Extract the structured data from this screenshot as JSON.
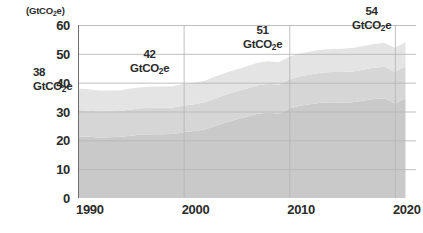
{
  "chart_data": {
    "type": "area",
    "title": "",
    "subtitle": "",
    "xlabel": "",
    "ylabel": "(GtCO2e)",
    "ylabel_html": "(GtCO<sub>2</sub>e)",
    "xlim": [
      1990,
      2022
    ],
    "ylim": [
      0,
      60
    ],
    "ytick_values": [
      0,
      10,
      20,
      30,
      40,
      50,
      60
    ],
    "ytick_labels": [
      "0",
      "10",
      "20",
      "30",
      "40",
      "50",
      "60"
    ],
    "xtick_values": [
      1990,
      2000,
      2010,
      2020
    ],
    "xtick_labels": [
      "1990",
      "2000",
      "2010",
      "2020"
    ],
    "grid": true,
    "legend_position": "none",
    "stacked": true,
    "x": [
      1990,
      1991,
      1992,
      1993,
      1994,
      1995,
      1996,
      1997,
      1998,
      1999,
      2000,
      2001,
      2002,
      2003,
      2004,
      2005,
      2006,
      2007,
      2008,
      2009,
      2010,
      2011,
      2012,
      2013,
      2014,
      2015,
      2016,
      2017,
      2018,
      2019,
      2020,
      2021
    ],
    "series": [
      {
        "name": "band-1",
        "color": "#c9c9c9",
        "values": [
          21.3,
          21.2,
          21.0,
          21.1,
          21.2,
          21.6,
          22.0,
          22.1,
          22.1,
          22.2,
          22.8,
          23.2,
          23.8,
          25.0,
          26.2,
          27.2,
          28.2,
          29.2,
          29.6,
          29.3,
          31.0,
          32.0,
          32.5,
          33.0,
          33.2,
          33.1,
          33.2,
          33.7,
          34.3,
          34.5,
          32.8,
          34.5
        ]
      },
      {
        "name": "band-2",
        "color": "#d6d6d6",
        "values": [
          9.2,
          9.1,
          9.0,
          9.0,
          9.0,
          9.1,
          9.1,
          9.2,
          9.2,
          9.2,
          9.3,
          9.3,
          9.4,
          9.5,
          9.6,
          9.7,
          9.8,
          9.9,
          10.0,
          10.0,
          10.1,
          10.2,
          10.3,
          10.4,
          10.5,
          10.6,
          10.7,
          10.8,
          10.9,
          11.0,
          11.0,
          11.1
        ]
      },
      {
        "name": "band-3",
        "color": "#e4e4e4",
        "values": [
          7.5,
          7.4,
          7.3,
          7.2,
          7.2,
          7.3,
          7.3,
          7.4,
          7.4,
          7.4,
          7.5,
          7.5,
          7.5,
          7.6,
          7.6,
          7.7,
          7.7,
          7.8,
          7.8,
          7.8,
          7.9,
          7.9,
          8.0,
          8.0,
          8.0,
          8.1,
          8.1,
          8.2,
          8.2,
          8.3,
          8.3,
          8.4
        ]
      }
    ],
    "totals": [
      38.0,
      37.7,
      37.3,
      37.3,
      37.4,
      38.0,
      38.4,
      38.7,
      38.7,
      38.8,
      39.6,
      40.0,
      40.7,
      42.1,
      43.4,
      44.6,
      45.7,
      46.9,
      47.4,
      47.1,
      49.0,
      50.1,
      50.8,
      51.4,
      51.7,
      51.8,
      52.0,
      52.7,
      53.4,
      53.8,
      52.1,
      54.0
    ]
  },
  "annotations": [
    {
      "name": "annotation-1990",
      "value": "38",
      "unit": "GtCO2e",
      "unit_html": "GtCO<sub>2</sub>e",
      "year": 1990
    },
    {
      "name": "annotation-2000",
      "value": "42",
      "unit": "GtCO2e",
      "unit_html": "GtCO<sub>2</sub>e",
      "year": 2000
    },
    {
      "name": "annotation-2010",
      "value": "51",
      "unit": "GtCO2e",
      "unit_html": "GtCO<sub>2</sub>e",
      "year": 2010
    },
    {
      "name": "annotation-2020",
      "value": "54",
      "unit": "GtCO2e",
      "unit_html": "GtCO<sub>2</sub>e",
      "year": 2020
    }
  ],
  "colors": {
    "grid": "#b8b8b8",
    "axis": "#6e6e6e",
    "text": "#2b2b2b",
    "band_1": "#c9c9c9",
    "band_2": "#d6d6d6",
    "band_3": "#e4e4e4",
    "background": "#ffffff"
  }
}
